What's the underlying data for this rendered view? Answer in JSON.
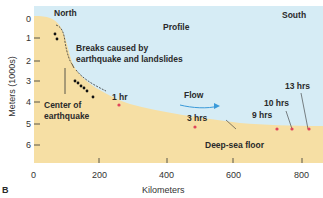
{
  "figure": {
    "panel_letter": "B",
    "title": "Profile",
    "north_label": "North",
    "south_label": "South",
    "breaks_label_line1": "Breaks caused by",
    "breaks_label_line2": "earthquake and landslides",
    "center_label_line1": "Center of",
    "center_label_line2": "earthquake",
    "flow_label": "Flow",
    "floor_label": "Deep-sea floor",
    "xlabel": "Kilometers",
    "ylabel": "Meters (1000s)",
    "x_ticks": [
      "0",
      "200",
      "400",
      "600",
      "800"
    ],
    "y_ticks": [
      "0",
      "1",
      "2",
      "3",
      "4",
      "5",
      "6"
    ],
    "time_markers": [
      {
        "label": "1 hr",
        "km": 265,
        "depth": 4.3
      },
      {
        "label": "3 hrs",
        "km": 490,
        "depth": 5.15
      },
      {
        "label": "9 hrs",
        "km": 730,
        "depth": 5.3
      },
      {
        "label": "10 hrs",
        "km": 775,
        "depth": 5.3
      },
      {
        "label": "13 hrs",
        "km": 820,
        "depth": 5.3
      }
    ],
    "colors": {
      "water": "#d6ecf5",
      "land": "#f6dfa4",
      "marker": "#e0455a",
      "flow_arrow": "#3a9ad9",
      "text": "#2a2a2a"
    }
  }
}
